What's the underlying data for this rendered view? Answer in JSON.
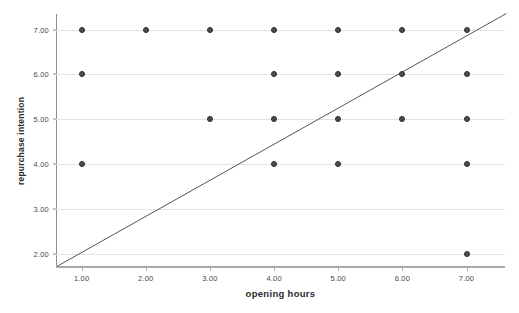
{
  "chart_data": {
    "type": "scatter",
    "title": "",
    "xlabel": "opening hours",
    "ylabel": "repurchase intention",
    "xlim": [
      0.6,
      7.6
    ],
    "ylim": [
      1.68,
      7.35
    ],
    "grid": true,
    "legend_position": "none",
    "xticks": [
      1,
      2,
      3,
      4,
      5,
      6,
      7
    ],
    "xtick_labels": [
      "1.00",
      "2.00",
      "3.00",
      "4.00",
      "5.00",
      "6.00",
      "7.00"
    ],
    "yticks": [
      2,
      3,
      4,
      5,
      6,
      7
    ],
    "ytick_labels": [
      "2.00",
      "3.00",
      "4.00",
      "5.00",
      "6.00",
      "7.00"
    ],
    "marker_color": "#4d4d4d",
    "marker_edge_color": "#2b2b2b",
    "gridline_color": "#e2e2e2",
    "axis_color": "#8d8d8d",
    "points": [
      {
        "x": 1,
        "y": 7
      },
      {
        "x": 1,
        "y": 6
      },
      {
        "x": 1,
        "y": 4
      },
      {
        "x": 2,
        "y": 7
      },
      {
        "x": 3,
        "y": 7
      },
      {
        "x": 3,
        "y": 5
      },
      {
        "x": 4,
        "y": 7
      },
      {
        "x": 4,
        "y": 6
      },
      {
        "x": 4,
        "y": 5
      },
      {
        "x": 4,
        "y": 4
      },
      {
        "x": 5,
        "y": 7
      },
      {
        "x": 5,
        "y": 6
      },
      {
        "x": 5,
        "y": 5
      },
      {
        "x": 5,
        "y": 4
      },
      {
        "x": 6,
        "y": 7
      },
      {
        "x": 6,
        "y": 6
      },
      {
        "x": 6,
        "y": 5
      },
      {
        "x": 7,
        "y": 7
      },
      {
        "x": 7,
        "y": 6
      },
      {
        "x": 7,
        "y": 5
      },
      {
        "x": 7,
        "y": 4
      },
      {
        "x": 7,
        "y": 2
      }
    ],
    "fit_line": {
      "label": "",
      "color": "#555555",
      "width": 1,
      "x_start": 0.62,
      "y_start": 1.72,
      "x_end": 7.62,
      "y_end": 7.36
    }
  }
}
